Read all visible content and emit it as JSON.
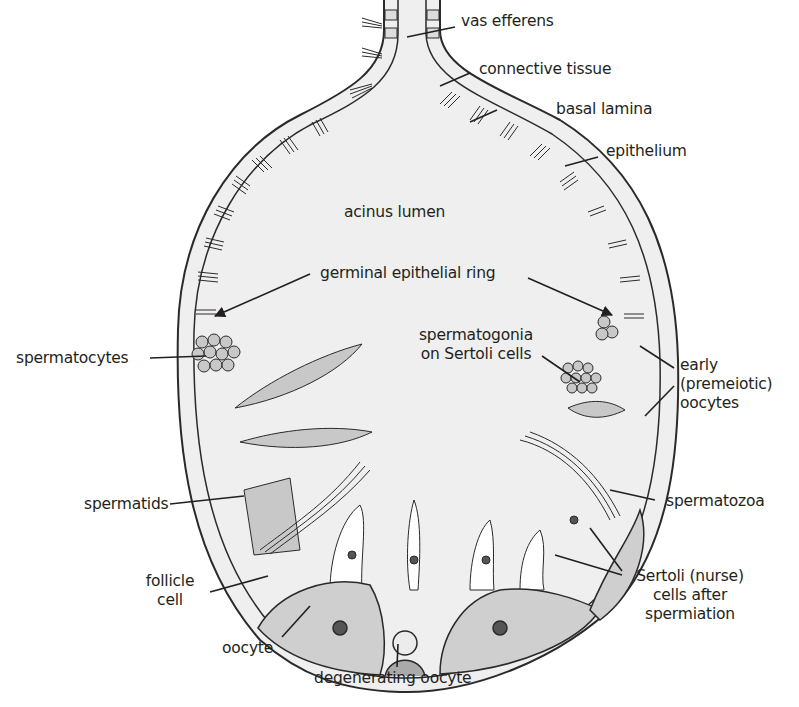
{
  "diagram": {
    "type": "anatomical cross-section",
    "colors": {
      "background": "#ffffff",
      "lumen": "#efefef",
      "outline": "#2a2a2a",
      "cell_fill": "#c8c8c8",
      "nucleus": "#555555",
      "oocyte_fill": "#cfcfcf",
      "text": "#231f20"
    },
    "labels": {
      "vas_efferens": "vas efferens",
      "connective_tissue": "connective tissue",
      "basal_lamina": "basal lamina",
      "epithelium": "epithelium",
      "acinus_lumen": "acinus lumen",
      "germinal_epithelial_ring": "germinal epithelial ring",
      "spermatocytes": "spermatocytes",
      "spermatogonia_line1": "spermatogonia",
      "spermatogonia_line2": "on Sertoli cells",
      "early_oocytes_line1": "early",
      "early_oocytes_line2": "(premeiotic)",
      "early_oocytes_line3": "oocytes",
      "spermatids": "spermatids",
      "spermatozoa": "spermatozoa",
      "follicle_cell_line1": "follicle",
      "follicle_cell_line2": "cell",
      "sertoli_line1": "Sertoli (nurse)",
      "sertoli_line2": "cells after",
      "sertoli_line3": "spermiation",
      "oocyte": "oocyte",
      "degenerating_oocyte": "degenerating oocyte"
    }
  }
}
